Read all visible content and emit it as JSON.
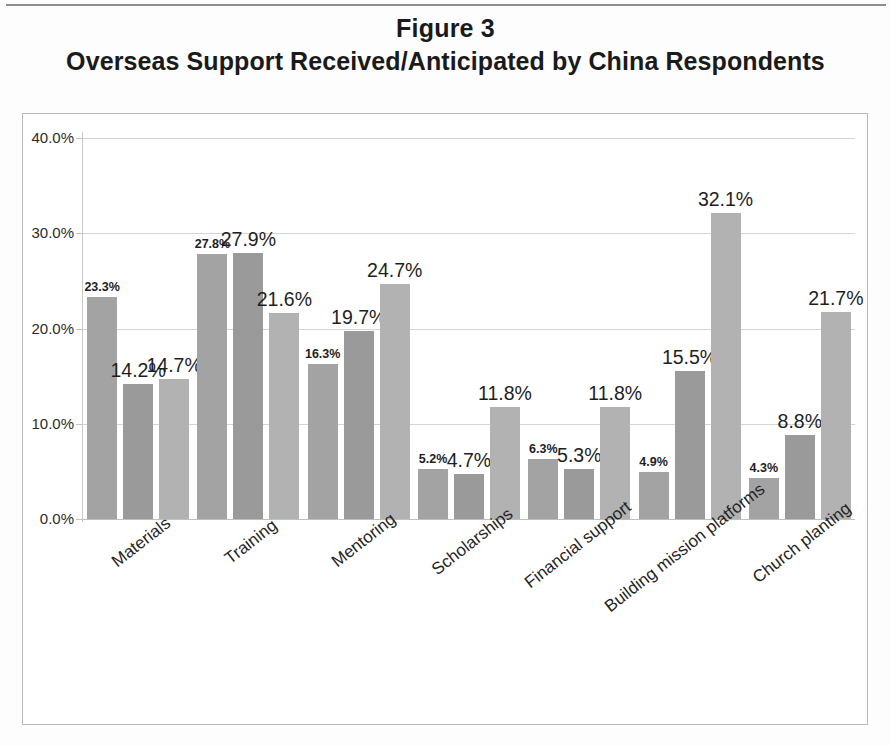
{
  "figure": {
    "title_line1": "Figure 3",
    "title_line2": "Overseas Support Received/Anticipated by China Respondents"
  },
  "axis": {
    "y_ticks": [
      "0.0%",
      "10.0%",
      "20.0%",
      "30.0%",
      "40.0%"
    ]
  },
  "chart_data": {
    "type": "bar",
    "xlabel": "",
    "ylabel": "",
    "ylim": [
      0,
      40
    ],
    "ytick_values": [
      0,
      10,
      20,
      30,
      40
    ],
    "ytick_labels": [
      "0.0%",
      "10.0%",
      "20.0%",
      "30.0%",
      "40.0%"
    ],
    "grid": true,
    "legend": "none",
    "units": "percent",
    "categories": [
      "Materials",
      "Training",
      "Mentoring",
      "Scholarships",
      "Financial support",
      "Building mission platforms",
      "Church planting"
    ],
    "series": [
      {
        "name": "Series 1",
        "values": [
          23.3,
          27.8,
          16.3,
          5.2,
          6.3,
          4.9,
          4.3
        ],
        "labels": [
          "23.3%",
          "27.8%",
          "16.3%",
          "5.2%",
          "6.3%",
          "4.9%",
          "4.3%"
        ]
      },
      {
        "name": "Series 2",
        "values": [
          14.2,
          27.9,
          19.7,
          4.7,
          5.3,
          15.5,
          8.8
        ],
        "labels": [
          "14.2%",
          "27.9%",
          "19.7%",
          "4.7%",
          "5.3%",
          "15.5%",
          "8.8%"
        ]
      },
      {
        "name": "Series 3",
        "values": [
          14.7,
          21.6,
          24.7,
          11.8,
          11.8,
          32.1,
          21.7
        ],
        "labels": [
          "14.7%",
          "21.6%",
          "24.7%",
          "11.8%",
          "11.8%",
          "32.1%",
          "21.7%"
        ]
      }
    ],
    "colors": {
      "series1": "#a3a3a3",
      "series2": "#9a9a9a",
      "series3": "#b2b2b2",
      "gridline": "#d4d4d4",
      "text": "#1e1e1e"
    }
  }
}
